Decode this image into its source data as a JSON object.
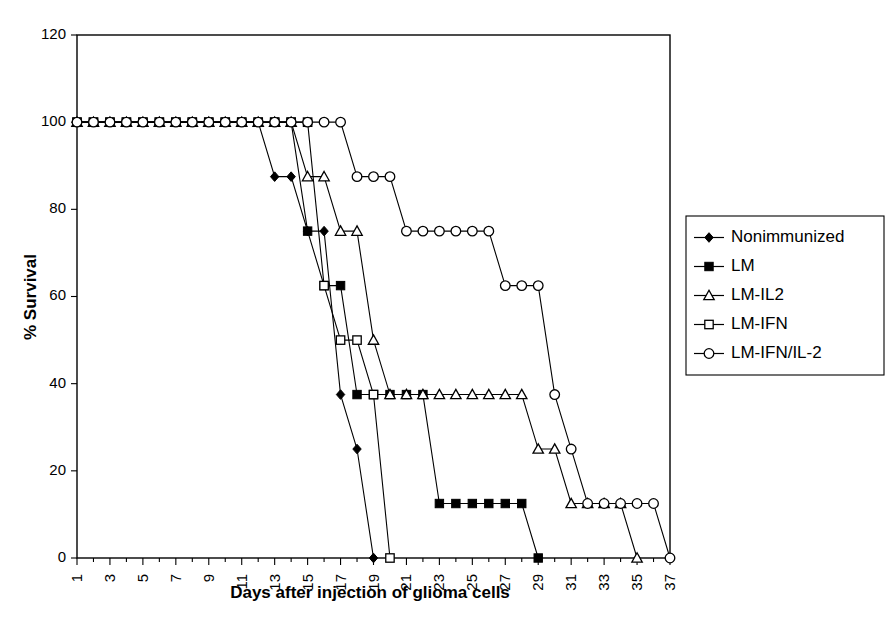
{
  "chart_data": {
    "type": "line",
    "title": "",
    "xlabel": "Days after injection of glioma cells",
    "ylabel": "% Survival",
    "ylim": [
      0,
      120
    ],
    "yticks": [
      0,
      20,
      40,
      60,
      80,
      100,
      120
    ],
    "xlim": [
      1,
      37
    ],
    "xticks": [
      1,
      3,
      5,
      7,
      9,
      11,
      13,
      15,
      17,
      19,
      21,
      23,
      25,
      27,
      29,
      31,
      33,
      35,
      37
    ],
    "xtick_labels": [
      "1",
      "3",
      "5",
      "7",
      "9",
      "11",
      "13",
      "15",
      "17",
      "19",
      "21",
      "23",
      "25",
      "27",
      "29",
      "31",
      "33",
      "35",
      "37"
    ],
    "xtick_rotation": 90,
    "minor_xticks_every": 1,
    "grid": false,
    "legend_position": "right",
    "series": [
      {
        "name": "Nonimmunized",
        "marker": "filled-diamond",
        "x": [
          1,
          2,
          3,
          4,
          5,
          6,
          7,
          8,
          9,
          10,
          11,
          12,
          13,
          14,
          15,
          16,
          17,
          18,
          19
        ],
        "values": [
          100,
          100,
          100,
          100,
          100,
          100,
          100,
          100,
          100,
          100,
          100,
          100,
          87.5,
          87.5,
          75,
          75,
          37.5,
          25,
          0
        ]
      },
      {
        "name": "LM",
        "marker": "filled-square",
        "x": [
          1,
          2,
          3,
          4,
          5,
          6,
          7,
          8,
          9,
          10,
          11,
          12,
          13,
          14,
          15,
          16,
          17,
          18,
          19,
          20,
          21,
          22,
          23,
          24,
          25,
          26,
          27,
          28,
          29
        ],
        "values": [
          100,
          100,
          100,
          100,
          100,
          100,
          100,
          100,
          100,
          100,
          100,
          100,
          100,
          100,
          75,
          62.5,
          62.5,
          37.5,
          37.5,
          37.5,
          37.5,
          37.5,
          12.5,
          12.5,
          12.5,
          12.5,
          12.5,
          12.5,
          0
        ]
      },
      {
        "name": "LM-IL2",
        "marker": "open-triangle",
        "x": [
          1,
          2,
          3,
          4,
          5,
          6,
          7,
          8,
          9,
          10,
          11,
          12,
          13,
          14,
          15,
          16,
          17,
          18,
          19,
          20,
          21,
          22,
          23,
          24,
          25,
          26,
          27,
          28,
          29,
          30,
          31,
          32,
          33,
          34,
          35
        ],
        "values": [
          100,
          100,
          100,
          100,
          100,
          100,
          100,
          100,
          100,
          100,
          100,
          100,
          100,
          100,
          87.5,
          87.5,
          75,
          75,
          50,
          37.5,
          37.5,
          37.5,
          37.5,
          37.5,
          37.5,
          37.5,
          37.5,
          37.5,
          25,
          25,
          12.5,
          12.5,
          12.5,
          12.5,
          0
        ]
      },
      {
        "name": "LM-IFN",
        "marker": "open-square",
        "x": [
          1,
          2,
          3,
          4,
          5,
          6,
          7,
          8,
          9,
          10,
          11,
          12,
          13,
          14,
          15,
          16,
          17,
          18,
          19,
          20
        ],
        "values": [
          100,
          100,
          100,
          100,
          100,
          100,
          100,
          100,
          100,
          100,
          100,
          100,
          100,
          100,
          100,
          62.5,
          50,
          50,
          37.5,
          0
        ]
      },
      {
        "name": "LM-IFN/IL-2",
        "marker": "open-circle",
        "x": [
          1,
          2,
          3,
          4,
          5,
          6,
          7,
          8,
          9,
          10,
          11,
          12,
          13,
          14,
          15,
          16,
          17,
          18,
          19,
          20,
          21,
          22,
          23,
          24,
          25,
          26,
          27,
          28,
          29,
          30,
          31,
          32,
          33,
          34,
          35,
          36,
          37
        ],
        "values": [
          100,
          100,
          100,
          100,
          100,
          100,
          100,
          100,
          100,
          100,
          100,
          100,
          100,
          100,
          100,
          100,
          100,
          87.5,
          87.5,
          87.5,
          75,
          75,
          75,
          75,
          75,
          75,
          62.5,
          62.5,
          62.5,
          37.5,
          25,
          12.5,
          12.5,
          12.5,
          12.5,
          12.5,
          0
        ]
      }
    ]
  },
  "legend": {
    "entries": [
      {
        "label": "Nonimmunized"
      },
      {
        "label": "LM"
      },
      {
        "label": "LM-IL2"
      },
      {
        "label": "LM-IFN"
      },
      {
        "label": "LM-IFN/IL-2"
      }
    ]
  },
  "colors": {
    "axis": "#000000",
    "line": "#000000",
    "marker_fill": "#000000",
    "marker_open_fill": "#ffffff",
    "background": "#ffffff"
  }
}
